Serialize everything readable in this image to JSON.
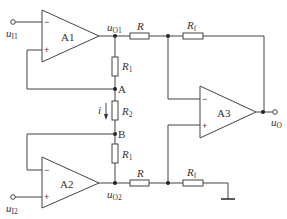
{
  "diagram": {
    "type": "circuit-schematic",
    "amplifiers": [
      {
        "id": "A1",
        "label": "A1",
        "minus_input": "u_I1",
        "plus_input": "node A feedback"
      },
      {
        "id": "A2",
        "label": "A2",
        "minus_input": "node B feedback",
        "plus_input": "u_I2"
      },
      {
        "id": "A3",
        "label": "A3",
        "output": "u_O"
      }
    ],
    "resistors": [
      {
        "id": "R1_top",
        "label": "R",
        "sub": "1"
      },
      {
        "id": "R2",
        "label": "R",
        "sub": "2"
      },
      {
        "id": "R1_bottom",
        "label": "R",
        "sub": "1"
      },
      {
        "id": "R_top",
        "label": "R",
        "sub": ""
      },
      {
        "id": "Rf_top",
        "label": "R",
        "sub": "f"
      },
      {
        "id": "R_bottom",
        "label": "R",
        "sub": ""
      },
      {
        "id": "Rf_bottom",
        "label": "R",
        "sub": "f"
      }
    ],
    "nodes": [
      {
        "id": "A",
        "label": "A"
      },
      {
        "id": "B",
        "label": "B"
      }
    ],
    "signals": {
      "in1": {
        "main": "u",
        "sub": "I1"
      },
      "in2": {
        "main": "u",
        "sub": "I2"
      },
      "o1": {
        "main": "u",
        "sub": "O1"
      },
      "o2": {
        "main": "u",
        "sub": "O2"
      },
      "out": {
        "main": "u",
        "sub": "O"
      }
    },
    "current": {
      "label": "i"
    },
    "signs": {
      "minus": "−",
      "plus": "+"
    }
  }
}
